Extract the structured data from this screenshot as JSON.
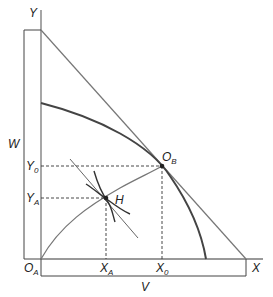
{
  "diagram": {
    "axes": {
      "y_label": "Y",
      "x_label": "X",
      "origin_label": "O",
      "origin_sub": "A"
    },
    "brackets": {
      "vertical_label": "W",
      "horizontal_label": "V"
    },
    "points": {
      "ob_label": "O",
      "ob_sub": "B",
      "h_label": "H"
    },
    "ticks": {
      "y0_label": "Y",
      "y0_sub": "0",
      "ya_label": "Y",
      "ya_sub": "A",
      "xa_label": "X",
      "xa_sub": "A",
      "x0_label": "X",
      "x0_sub": "0"
    },
    "colors": {
      "axis": "#777777",
      "curve": "#444444",
      "line": "#777777",
      "dashed": "#333333"
    }
  }
}
